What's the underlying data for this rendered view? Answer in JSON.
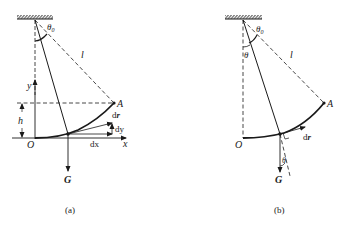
{
  "figure": {
    "panels": [
      {
        "id": "a",
        "caption": "(a)",
        "labels": {
          "theta0": "θ",
          "theta0_sub": "0",
          "length": "l",
          "y_axis": "y",
          "x_axis": "x",
          "height": "h",
          "point_A": "A",
          "origin": "O",
          "dr": "d",
          "dr_vec": "r",
          "dy": "dy",
          "dx": "dx",
          "gravity": "G"
        }
      },
      {
        "id": "b",
        "caption": "(b)",
        "labels": {
          "theta0": "θ",
          "theta0_sub": "0",
          "theta": "θ",
          "theta_force": "θ",
          "length": "l",
          "point_A": "A",
          "origin": "O",
          "dr": "d",
          "dr_vec": "r",
          "gravity": "G"
        }
      }
    ],
    "colors": {
      "ink": "#1a1a1a",
      "background": "#ffffff"
    }
  }
}
